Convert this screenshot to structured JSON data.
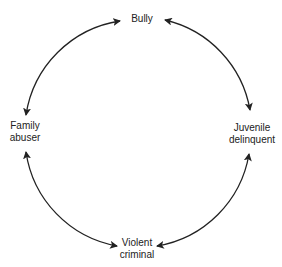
{
  "diagram": {
    "type": "cycle",
    "nodes": [
      {
        "id": "bully",
        "label": "Bully"
      },
      {
        "id": "juvenile",
        "label_line1": "Juvenile",
        "label_line2": "delinquent"
      },
      {
        "id": "violent",
        "label_line1": "Violent",
        "label_line2": "criminal"
      },
      {
        "id": "family",
        "label_line1": "Family",
        "label_line2": "abuser"
      }
    ],
    "edges": [
      {
        "from": "bully",
        "to": "juvenile",
        "bidirectional": true
      },
      {
        "from": "juvenile",
        "to": "violent",
        "bidirectional": true
      },
      {
        "from": "violent",
        "to": "family",
        "bidirectional": true
      },
      {
        "from": "family",
        "to": "bully",
        "bidirectional": true
      }
    ],
    "line_color": "#222222"
  }
}
